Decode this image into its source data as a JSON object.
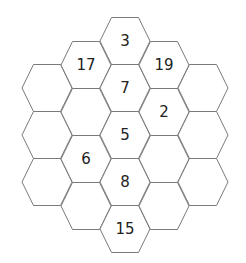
{
  "puzzle": {
    "type": "hexagonal-number-grid",
    "colors": {
      "line": "#7a7a7a",
      "text": "#222222",
      "background": "#ffffff"
    },
    "columns": [
      {
        "cells": [
          "",
          "",
          ""
        ]
      },
      {
        "cells": [
          "17",
          "",
          "6",
          ""
        ]
      },
      {
        "cells": [
          "3",
          "7",
          "5",
          "8",
          "15"
        ]
      },
      {
        "cells": [
          "19",
          "2",
          "",
          ""
        ]
      },
      {
        "cells": [
          "",
          "",
          ""
        ]
      }
    ]
  }
}
